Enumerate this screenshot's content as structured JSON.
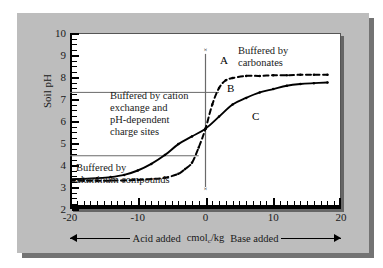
{
  "figure": {
    "background_color": "#bdbdbd",
    "plot_background_color": "#ffffff"
  },
  "chart_data": {
    "type": "line",
    "title": "",
    "xlabel": "Acid added  cmol_c/kg  Base added",
    "ylabel": "Soil pH",
    "xlim": [
      -20,
      20
    ],
    "ylim": [
      2,
      10
    ],
    "grid": false,
    "legend_position": "none",
    "x_ticks": [
      -20,
      -10,
      0,
      10,
      20
    ],
    "x_tick_labels": [
      "-20",
      "-10",
      "0",
      "10",
      "20"
    ],
    "y_ticks": [
      2,
      3,
      4,
      5,
      6,
      7,
      8,
      9,
      10
    ],
    "y_tick_labels": [
      "2",
      "3",
      "4",
      "5",
      "6",
      "7",
      "8",
      "9",
      "10"
    ],
    "x_minor_tick_interval": 1,
    "y_minor_tick_interval": 0.25,
    "series": [
      {
        "name": "C",
        "style": "solid",
        "color": "#000000",
        "markers": "small-dots",
        "x": [
          -20,
          -18,
          -16,
          -14,
          -12,
          -10,
          -8,
          -6,
          -4,
          -2,
          0,
          2,
          4,
          6,
          8,
          10,
          12,
          14,
          16,
          18
        ],
        "values": [
          3.35,
          3.37,
          3.4,
          3.45,
          3.55,
          3.75,
          4.05,
          4.45,
          4.95,
          5.3,
          5.65,
          6.2,
          6.75,
          7.05,
          7.3,
          7.45,
          7.6,
          7.68,
          7.72,
          7.75
        ]
      },
      {
        "name": "B",
        "style": "dashed",
        "color": "#000000",
        "markers": "small-dots",
        "x": [
          -20,
          -18,
          -16,
          -14,
          -12,
          -10,
          -8,
          -6,
          -4,
          -3,
          -2,
          -1,
          0,
          1,
          2,
          3,
          4,
          6,
          8,
          10,
          12,
          14,
          16,
          18
        ],
        "values": [
          3.28,
          3.28,
          3.28,
          3.29,
          3.3,
          3.32,
          3.36,
          3.42,
          3.6,
          3.82,
          4.1,
          4.8,
          5.65,
          6.75,
          7.5,
          7.85,
          7.95,
          8.05,
          8.05,
          8.08,
          8.08,
          8.1,
          8.1,
          8.1
        ]
      }
    ],
    "vertical_line": {
      "name": "A",
      "x": 0,
      "y_from": 3.0,
      "y_to": 9.05,
      "endpoint_marker": "x"
    },
    "reference_lines": [
      {
        "y": 7.3,
        "x_from": -20,
        "x_to": 2
      },
      {
        "y": 4.42,
        "x_from": -20,
        "x_to": -1
      }
    ],
    "annotations": [
      {
        "id": "cation",
        "lines": [
          "Buffered by cation",
          "exchange and",
          "pH-dependent",
          "charge sites"
        ]
      },
      {
        "id": "aluminum",
        "lines": [
          "Buffered by",
          "aluminum compounds"
        ]
      },
      {
        "id": "carbonates",
        "lines": [
          "Buffered by",
          "carbonates"
        ]
      }
    ],
    "curve_labels": [
      {
        "id": "A",
        "text": "A"
      },
      {
        "id": "B",
        "text": "B"
      },
      {
        "id": "C",
        "text": "C"
      }
    ]
  },
  "axis": {
    "y_title": "Soil pH",
    "x_caption_acid": "Acid added",
    "x_caption_units_pre": "cmol",
    "x_caption_units_sub": "c",
    "x_caption_units_post": "/kg",
    "x_caption_base": "Base added"
  },
  "annotations": {
    "cation_l1": "Buffered by cation",
    "cation_l2": "exchange and",
    "cation_l3": "pH-dependent",
    "cation_l4": "charge sites",
    "aluminum_l1": "Buffered by",
    "aluminum_l2": "aluminum compounds",
    "carbonates_l1": "Buffered by",
    "carbonates_l2": "carbonates"
  },
  "curve_labels": {
    "a": "A",
    "b": "B",
    "c": "C",
    "x_mark": "×"
  }
}
